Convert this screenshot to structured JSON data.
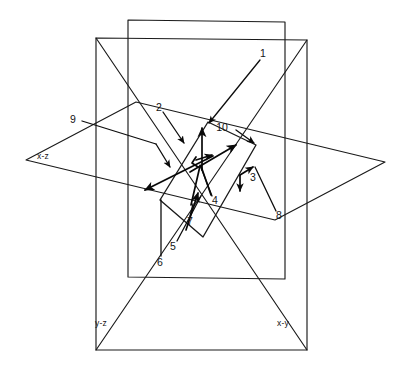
{
  "figure": {
    "background_color": "#ffffff",
    "line_color": "#1a1a1a",
    "width": 407,
    "height": 386
  },
  "plane_labels": [
    {
      "id": "x-z",
      "text": "x-z",
      "x": 43,
      "y": 157
    },
    {
      "id": "y-z",
      "text": "y-z",
      "x": 101,
      "y": 324
    },
    {
      "id": "x-y",
      "text": "x-y",
      "x": 283,
      "y": 324
    }
  ],
  "callouts": [
    {
      "id": "1",
      "text": "1",
      "x": 263,
      "y": 54
    },
    {
      "id": "2",
      "text": "2",
      "x": 159,
      "y": 108
    },
    {
      "id": "3",
      "text": "3",
      "x": 253,
      "y": 178
    },
    {
      "id": "4",
      "text": "4",
      "x": 215,
      "y": 201
    },
    {
      "id": "5",
      "text": "5",
      "x": 173,
      "y": 247
    },
    {
      "id": "6",
      "text": "6",
      "x": 160,
      "y": 263
    },
    {
      "id": "7",
      "text": "7",
      "x": 190,
      "y": 222
    },
    {
      "id": "8",
      "text": "8",
      "x": 279,
      "y": 216
    },
    {
      "id": "9",
      "text": "9",
      "x": 73,
      "y": 120
    },
    {
      "id": "10",
      "text": "10",
      "x": 222,
      "y": 128
    }
  ],
  "geometry": {
    "horizontal_plane": "26,160 136,102 385,162 275,220",
    "yz_plane": "128,20 285,22 285,279 128,277",
    "xy_plane": "96,38 307,40 307,350 96,350",
    "inner_quad": "208,122 256,145 203,237 160,200",
    "xy_diag_left": "96,38 307,350",
    "xy_diag_right": "307,40 96,350"
  },
  "vectors": {
    "origin": "200,163",
    "count": 10,
    "description": "Ten annotated direction arrows emanating near the common origin of the three planes"
  }
}
